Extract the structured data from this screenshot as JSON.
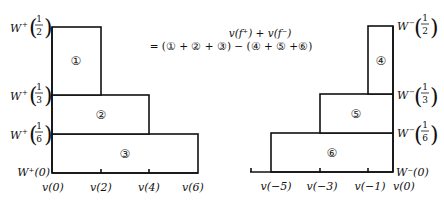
{
  "formula": {
    "line1": "v(f⁺) + v(f⁻)",
    "line2": "= (① + ② + ③) − (④ + ⑤ +⑥)"
  },
  "left_panel": {
    "y_labels": [
      {
        "prefix": "W",
        "sign": "+",
        "num": "1",
        "den": "2"
      },
      {
        "prefix": "W",
        "sign": "+",
        "num": "1",
        "den": "3"
      },
      {
        "prefix": "W",
        "sign": "+",
        "num": "1",
        "den": "6"
      },
      {
        "text": "W⁺(0)"
      }
    ],
    "x_labels": [
      "v(0)",
      "v(2)",
      "v(4)",
      "v(6)"
    ],
    "regions": [
      "①",
      "②",
      "③"
    ]
  },
  "right_panel": {
    "y_labels": [
      {
        "prefix": "W",
        "sign": "−",
        "num": "1",
        "den": "2"
      },
      {
        "prefix": "W",
        "sign": "−",
        "num": "1",
        "den": "3"
      },
      {
        "prefix": "W",
        "sign": "−",
        "num": "1",
        "den": "6"
      },
      {
        "text": "W⁻(0)"
      }
    ],
    "x_labels": [
      "v(−5)",
      "v(−3)",
      "v(−1)",
      "v(0)"
    ],
    "regions": [
      "④",
      "⑤",
      "⑥"
    ]
  }
}
